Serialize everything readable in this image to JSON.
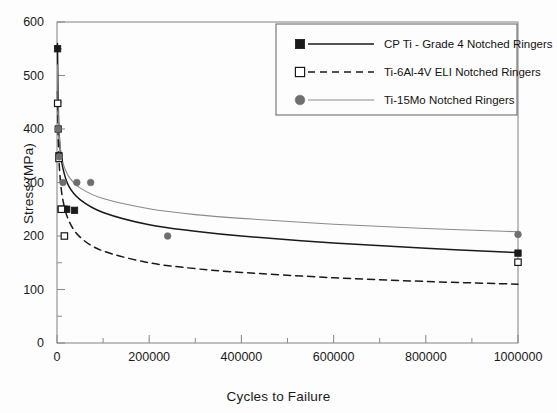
{
  "chart_data": {
    "type": "scatter",
    "title": "",
    "xlabel": "Cycles to Failure",
    "ylabel": "Stress (MPa)",
    "xlim": [
      0,
      1000000
    ],
    "ylim": [
      0,
      600
    ],
    "xticks": [
      0,
      200000,
      400000,
      600000,
      800000,
      1000000
    ],
    "xtick_labels": [
      "0",
      "200000",
      "400000",
      "600000",
      "800000",
      "1000000"
    ],
    "yticks": [
      0,
      100,
      200,
      300,
      400,
      500,
      600
    ],
    "ytick_labels": [
      "0",
      "100",
      "200",
      "300",
      "400",
      "500",
      "600"
    ],
    "x_minor_interval": 100000,
    "y_minor_interval": 50,
    "grid": false,
    "legend_position": "top-right",
    "series": [
      {
        "name": "CP Ti - Grade 4 Notched Ringers",
        "marker": "filled-square",
        "color": "#1a1a1a",
        "line_style": "solid",
        "line_color": "#1a1a1a",
        "points": [
          {
            "x": 1200,
            "y": 550
          },
          {
            "x": 2600,
            "y": 400
          },
          {
            "x": 4200,
            "y": 350
          },
          {
            "x": 5200,
            "y": 345
          },
          {
            "x": 9000,
            "y": 250
          },
          {
            "x": 16000,
            "y": 250
          },
          {
            "x": 21000,
            "y": 250
          },
          {
            "x": 38000,
            "y": 248
          },
          {
            "x": 1000000,
            "y": 168
          }
        ],
        "fit_curve": [
          {
            "x": 1000,
            "y": 560
          },
          {
            "x": 3000,
            "y": 430
          },
          {
            "x": 6000,
            "y": 372
          },
          {
            "x": 12000,
            "y": 330
          },
          {
            "x": 25000,
            "y": 294
          },
          {
            "x": 50000,
            "y": 268
          },
          {
            "x": 100000,
            "y": 244
          },
          {
            "x": 200000,
            "y": 221
          },
          {
            "x": 300000,
            "y": 209
          },
          {
            "x": 400000,
            "y": 200
          },
          {
            "x": 600000,
            "y": 187
          },
          {
            "x": 800000,
            "y": 177
          },
          {
            "x": 1000000,
            "y": 169
          }
        ]
      },
      {
        "name": "Ti-6Al-4V ELI Notched Ringers",
        "marker": "open-square",
        "color": "#1a1a1a",
        "line_style": "dashed",
        "line_color": "#1a1a1a",
        "points": [
          {
            "x": 1500,
            "y": 448
          },
          {
            "x": 4400,
            "y": 345
          },
          {
            "x": 9500,
            "y": 250
          },
          {
            "x": 16000,
            "y": 200
          },
          {
            "x": 1000000,
            "y": 151
          }
        ],
        "fit_curve": [
          {
            "x": 1000,
            "y": 470
          },
          {
            "x": 3000,
            "y": 372
          },
          {
            "x": 6000,
            "y": 318
          },
          {
            "x": 12000,
            "y": 271
          },
          {
            "x": 25000,
            "y": 230
          },
          {
            "x": 50000,
            "y": 198
          },
          {
            "x": 100000,
            "y": 172
          },
          {
            "x": 200000,
            "y": 150
          },
          {
            "x": 300000,
            "y": 139
          },
          {
            "x": 400000,
            "y": 132
          },
          {
            "x": 600000,
            "y": 122
          },
          {
            "x": 800000,
            "y": 115
          },
          {
            "x": 1000000,
            "y": 110
          }
        ]
      },
      {
        "name": "Ti-15Mo Notched Ringers",
        "marker": "filled-circle",
        "color": "#6e6e6e",
        "line_style": "solid",
        "line_color": "#8a8a8a",
        "points": [
          {
            "x": 2400,
            "y": 400
          },
          {
            "x": 4600,
            "y": 348
          },
          {
            "x": 13000,
            "y": 300
          },
          {
            "x": 43000,
            "y": 300
          },
          {
            "x": 73000,
            "y": 300
          },
          {
            "x": 240000,
            "y": 200
          },
          {
            "x": 1000000,
            "y": 203
          }
        ],
        "fit_curve": [
          {
            "x": 1000,
            "y": 520
          },
          {
            "x": 3000,
            "y": 420
          },
          {
            "x": 6000,
            "y": 375
          },
          {
            "x": 12000,
            "y": 340
          },
          {
            "x": 25000,
            "y": 312
          },
          {
            "x": 50000,
            "y": 290
          },
          {
            "x": 100000,
            "y": 270
          },
          {
            "x": 200000,
            "y": 251
          },
          {
            "x": 300000,
            "y": 240
          },
          {
            "x": 400000,
            "y": 233
          },
          {
            "x": 600000,
            "y": 222
          },
          {
            "x": 800000,
            "y": 214
          },
          {
            "x": 1000000,
            "y": 208
          }
        ]
      }
    ]
  },
  "legend": {
    "entries": [
      {
        "label": "CP Ti - Grade 4 Notched Ringers"
      },
      {
        "label": "Ti-6Al-4V ELI Notched Ringers"
      },
      {
        "label": "Ti-15Mo Notched Ringers"
      }
    ]
  },
  "colors": {
    "axis": "#8c8c8c",
    "text": "#1a1a1a",
    "series_1": "#1a1a1a",
    "series_2": "#1a1a1a",
    "series_3": "#8a8a8a",
    "background": "#fdfdfd"
  }
}
